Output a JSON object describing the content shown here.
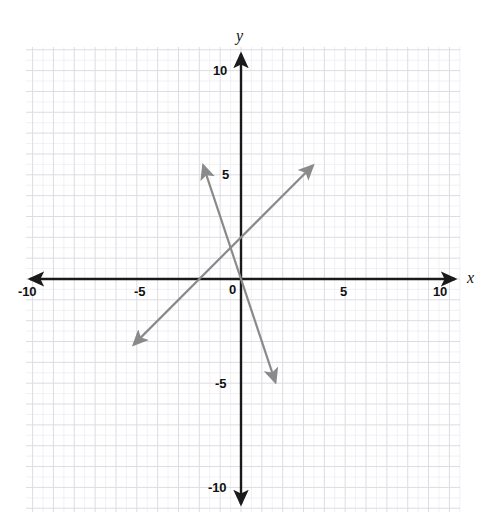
{
  "figure": {
    "title": "",
    "width": 485,
    "height": 517,
    "background_color": "#ffffff"
  },
  "axes": {
    "x_label": "x",
    "y_label": "y",
    "origin_label": "0",
    "axis_color": "#1a1a1a",
    "x_ticks": [
      {
        "value": -10,
        "label": "-10"
      },
      {
        "value": -5,
        "label": "-5"
      },
      {
        "value": 5,
        "label": "5"
      },
      {
        "value": 10,
        "label": "10"
      }
    ],
    "y_ticks": [
      {
        "value": 10,
        "label": "10"
      },
      {
        "value": 5,
        "label": "5"
      },
      {
        "value": -5,
        "label": "-5"
      },
      {
        "value": -10,
        "label": "-10"
      }
    ]
  },
  "grid": {
    "visible": true,
    "minor_color": "#ededf2",
    "major_color": "#dcdce4",
    "minor_step": 1,
    "major_step": 2
  },
  "chart_data": {
    "type": "line",
    "title": "",
    "xlabel": "x",
    "ylabel": "y",
    "xlim": [
      -10.8,
      10.8
    ],
    "ylim": [
      -11.4,
      11.4
    ],
    "grid": true,
    "legend": "none",
    "series": [
      {
        "name": "line-1",
        "equation": "y = x + 4",
        "slope": 1,
        "intercept": 4,
        "color": "#8a8a8a",
        "arrow_start": true,
        "arrow_end": true,
        "x": [
          -10.3,
          6.9
        ],
        "values": [
          -6.3,
          10.9
        ],
        "x_intercept": -4,
        "y_intercept": 4
      },
      {
        "name": "line-2",
        "equation": "y = -3x",
        "slope": -3,
        "intercept": 0,
        "color": "#8a8a8a",
        "arrow_start": true,
        "arrow_end": true,
        "x": [
          -3.63,
          3.3
        ],
        "values": [
          10.9,
          -9.9
        ],
        "x_intercept": 0,
        "y_intercept": 0
      }
    ],
    "intersection": {
      "x": -1,
      "y": 3
    }
  }
}
